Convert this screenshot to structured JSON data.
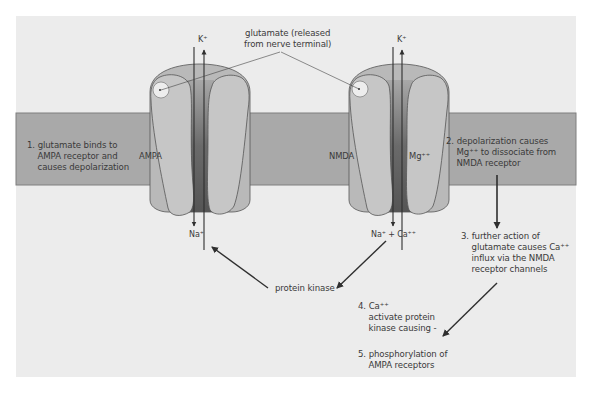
{
  "colors": {
    "page": "#ffffff",
    "panel": "#ececec",
    "membrane": "#a9a9a9",
    "membrane_border": "#7e7e7e",
    "receptor": "#c4c4c4",
    "receptor_outline": "#555555",
    "channel_dark": "#6c6c6c",
    "arrow": "#2f2f2f",
    "text": "#3a3a3a"
  },
  "receptors": [
    {
      "name": "AMPA",
      "top_ion": "K⁺",
      "bottom_ion": "Na⁺"
    },
    {
      "name": "NMDA",
      "top_ion": "K⁺",
      "bottom_ion": "Na⁺ + Ca⁺⁺",
      "blocker": "Mg⁺⁺"
    }
  ],
  "labels": {
    "glutamate": "glutamate (released\nfrom nerve terminal)",
    "step1": "1. glutamate binds to\n    AMPA receptor and\n    causes depolarization",
    "step2": "2. depolarization causes\n    Mg⁺⁺ to dissociate from\n    NMDA receptor",
    "step3": "3. further action of\n    glutamate causes Ca⁺⁺\n    influx via the NMDA\n    receptor channels",
    "step4": "4. Ca⁺⁺\n    activate protein\n    kinase causing -",
    "step5": "5. phosphorylation of\n    AMPA receptors",
    "protein_kinase": "protein kinase"
  }
}
